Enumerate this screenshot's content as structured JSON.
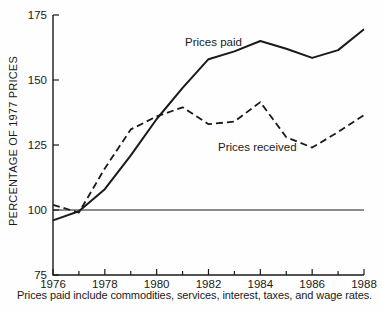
{
  "figure": {
    "background": "#fefefe",
    "ink": "#1a1a1a"
  },
  "chart_data": {
    "type": "line",
    "title": "",
    "xlabel": "",
    "ylabel": "PERCENTAGE OF 1977 PRICES",
    "xlim": [
      1976,
      1988
    ],
    "ylim": [
      75,
      175
    ],
    "yticks": [
      75,
      100,
      125,
      150,
      175
    ],
    "xticks_minor_every": 1,
    "xtick_labels": [
      1976,
      1978,
      1980,
      1982,
      1984,
      1986,
      1988
    ],
    "grid": false,
    "legend": "inline-labels",
    "reference_line_y": 100,
    "x": [
      1976,
      1977,
      1978,
      1979,
      1980,
      1981,
      1982,
      1983,
      1984,
      1985,
      1986,
      1987,
      1988
    ],
    "series": [
      {
        "name": "Prices paid",
        "style": "solid",
        "values": [
          96,
          99.5,
          108,
          121,
          135,
          147,
          158,
          161,
          165,
          162,
          158.5,
          161.5,
          169.5
        ]
      },
      {
        "name": "Prices received",
        "style": "dashed",
        "values": [
          102,
          99,
          116,
          131,
          136,
          139.5,
          133,
          134,
          141.5,
          128,
          124,
          130,
          136.5
        ]
      }
    ]
  },
  "caption": "Prices paid include commodities, services, interest, taxes, and wage rates."
}
